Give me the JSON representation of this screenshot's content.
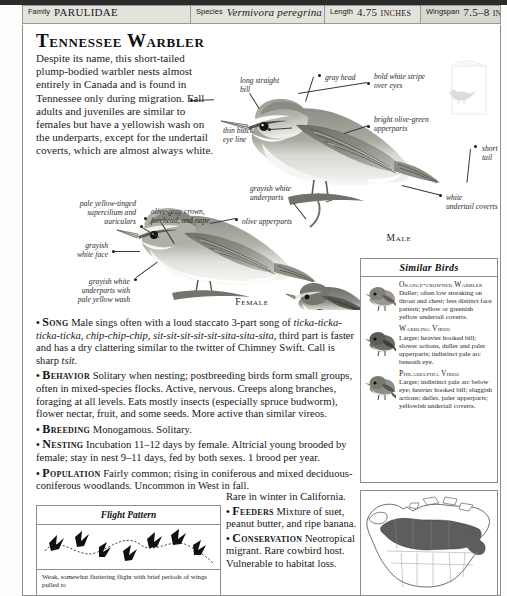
{
  "header": {
    "fields": [
      {
        "key": "Family",
        "value": "PARULIDAE",
        "italic": false
      },
      {
        "key": "Species",
        "value": "Vermivora peregrina",
        "italic": true
      },
      {
        "key": "Length",
        "value": "4.75 inches",
        "italic": false
      },
      {
        "key": "Wingspan",
        "value": "7.5–8 inches",
        "italic": false
      }
    ]
  },
  "title": "Tennessee Warbler",
  "intro": "Despite its name, this short-tailed plump-bodied warbler nests almost entirely in Canada and is found in Tennessee only during migration. Fall adults and juveniles are similar to females but have a yellowish wash on the underparts, except for the undertail coverts, which are almost always white.",
  "annotations": [
    {
      "id": "long-straight-bill",
      "text": "long straight\nbill"
    },
    {
      "id": "gray-head",
      "text": "gray head"
    },
    {
      "id": "bold-white-stripe",
      "text": "bold white stripe\nover eyes"
    },
    {
      "id": "thin-black-eye-line",
      "text": "thin black\neye line"
    },
    {
      "id": "bright-olive-green",
      "text": "bright olive-green\nupperparts"
    },
    {
      "id": "short-tail",
      "text": "short tail"
    },
    {
      "id": "white-undertail",
      "text": "white\nundertail coverts"
    },
    {
      "id": "grayish-white-under",
      "text": "grayish white\nunderparts"
    },
    {
      "id": "pale-yellow-supercil",
      "text": "pale yellow-tinged\nsupercilium and\nauriculars"
    },
    {
      "id": "olive-gray-crown",
      "text": "olive-gray crown,\nforehead, and nape"
    },
    {
      "id": "olive-upperparts",
      "text": "olive upperparts"
    },
    {
      "id": "grayish-white-face",
      "text": "grayish\nwhite face"
    },
    {
      "id": "grayish-white-wash",
      "text": "grayish white\nunderparts with\npale yellow wash"
    }
  ],
  "captions": {
    "male": "Male",
    "female": "Female",
    "fall_plumage": "Fall\nPlumage"
  },
  "similar_birds": {
    "heading": "Similar Birds",
    "items": [
      {
        "name": "Orange-crowned Warbler",
        "text": "Duller; often low streaking on throat and chest; less distinct face pattern; yellow or greenish yellow undertail coverts."
      },
      {
        "name": "Warbling Vireo",
        "text": "Larger; heavier hooked bill; slower actions, duller and paler upperparts; indistinct pale arc beneath eye."
      },
      {
        "name": "Philadelphia Vireo",
        "text": "Larger; indistinct pale arc below eye; heavier hooked bill; sluggish actions; duller, paler upperparts; yellowish undertail coverts."
      }
    ]
  },
  "sections": [
    {
      "label": "Song",
      "parts": [
        {
          "t": "Male sings often with a loud staccato 3-part song of ",
          "i": false
        },
        {
          "t": "ticka-ticka-ticka-ticka, chip-chip-chip, sit-sit-sit-sit-sit-sita-sita-sita,",
          "i": true
        },
        {
          "t": " third part is faster and has a dry clattering similar to the twitter of Chimney Swift. Call is sharp ",
          "i": false
        },
        {
          "t": "tsit.",
          "i": true
        }
      ]
    },
    {
      "label": "Behavior",
      "parts": [
        {
          "t": "Solitary when nesting; postbreeding birds form small groups, often in mixed-species flocks. Active, nervous. Creeps along branches, foraging at all levels. Eats mostly insects (especially spruce budworm), flower nectar, fruit, and some seeds. More active than similar vireos.",
          "i": false
        }
      ]
    },
    {
      "label": "Breeding",
      "parts": [
        {
          "t": " Monogamous. Solitary.",
          "i": false
        }
      ]
    },
    {
      "label": "Nesting",
      "parts": [
        {
          "t": "Incubation 11–12 days by female. Altricial young brooded by female; stay in nest 9–11 days, fed by both sexes. 1 brood per year.",
          "i": false
        }
      ]
    },
    {
      "label": "Population",
      "parts": [
        {
          "t": "Fairly common; rising in coniferous and mixed deciduous-coniferous woodlands. Uncommon in West in fall.",
          "i": false
        }
      ]
    }
  ],
  "right_sections": [
    {
      "lead": "Rare in winter in California.",
      "label": "",
      "parts": []
    },
    {
      "lead": "",
      "label": "Feeders",
      "parts": [
        {
          "t": "Mixture of suet, peanut butter, and ripe banana.",
          "i": false
        }
      ]
    },
    {
      "lead": "",
      "label": "Conservation",
      "parts": [
        {
          "t": " Neotropical migrant. Rare cowbird host. Vulnerable to habitat loss.",
          "i": false
        }
      ]
    }
  ],
  "flight_pattern": {
    "heading": "Flight Pattern",
    "caption": "Weak, somewhat fluttering flight with brief periods of wings pulled to"
  },
  "colors": {
    "ink": "#161616",
    "rule": "#8d8d8d",
    "header_bg": "#e4e2dd",
    "header_bg_alt": "#d9d7d1",
    "range_fill": "#5d5d5d"
  }
}
